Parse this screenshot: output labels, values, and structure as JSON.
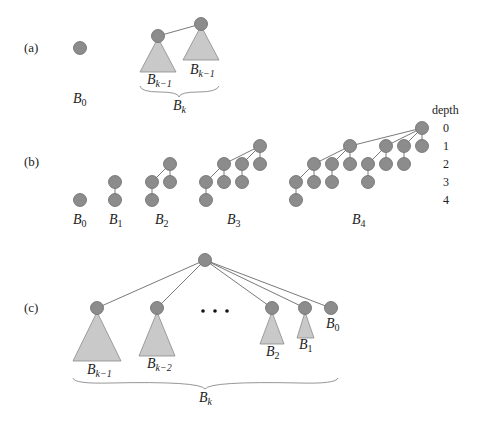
{
  "figure": {
    "panels": {
      "a": {
        "label": "(a)",
        "b0": {
          "base": "B",
          "sub": "0"
        },
        "left_subtree": {
          "base": "B",
          "sub": "k−1"
        },
        "right_subtree": {
          "base": "B",
          "sub": "k−1"
        },
        "brace": {
          "base": "B",
          "sub": "k"
        }
      },
      "b": {
        "label": "(b)",
        "trees": [
          {
            "base": "B",
            "sub": "0"
          },
          {
            "base": "B",
            "sub": "1"
          },
          {
            "base": "B",
            "sub": "2"
          },
          {
            "base": "B",
            "sub": "3"
          },
          {
            "base": "B",
            "sub": "4"
          }
        ],
        "depth_header": "depth",
        "depths": [
          "0",
          "1",
          "2",
          "3",
          "4"
        ]
      },
      "c": {
        "label": "(c)",
        "subtrees": [
          {
            "base": "B",
            "sub": "k−1"
          },
          {
            "base": "B",
            "sub": "k−2"
          },
          {
            "base": "B",
            "sub": "2"
          },
          {
            "base": "B",
            "sub": "1"
          },
          {
            "base": "B",
            "sub": "0"
          }
        ],
        "ellipsis": "• • •",
        "brace": {
          "base": "B",
          "sub": "k"
        }
      }
    },
    "colors": {
      "node_fill": "#8c8c8c",
      "node_stroke": "#6a6a6a",
      "triangle_fill": "#c9c9c9",
      "triangle_stroke": "#8a8a8a"
    }
  }
}
